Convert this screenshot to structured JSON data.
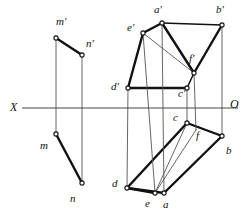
{
  "canvas": {
    "width": 248,
    "height": 217,
    "background": "#ffffff"
  },
  "style": {
    "line_color": "#111111",
    "thin_color": "#555555",
    "axis_color": "#444444",
    "vertex_fill": "#ffffff",
    "thick_width": 2.4,
    "medium_width": 1.5,
    "thin_width": 0.9,
    "axis_width": 1.0
  },
  "axis": {
    "name": "ground-line",
    "x1": 22,
    "y1": 108,
    "x2": 238,
    "y2": 108,
    "left_label": "X",
    "right_label": "O",
    "left_label_pos": {
      "x": 10,
      "y": 101
    },
    "right_label_pos": {
      "x": 230,
      "y": 98
    }
  },
  "vertices": [
    {
      "id": "m_top",
      "label": "m'",
      "x": 56,
      "y": 38,
      "label_x": 56,
      "label_y": 16,
      "marker": "circle"
    },
    {
      "id": "n_top",
      "label": "n'",
      "x": 82,
      "y": 55,
      "label_x": 86,
      "label_y": 38,
      "marker": "circle"
    },
    {
      "id": "m_bot",
      "label": "m",
      "x": 56,
      "y": 134,
      "label_x": 40,
      "label_y": 140,
      "marker": "circle"
    },
    {
      "id": "n_bot",
      "label": "n",
      "x": 82,
      "y": 183,
      "label_x": 70,
      "label_y": 193,
      "marker": "circle"
    },
    {
      "id": "a_top",
      "label": "a'",
      "x": 162,
      "y": 23,
      "label_x": 154,
      "label_y": 4,
      "marker": "circle"
    },
    {
      "id": "b_top",
      "label": "b'",
      "x": 222,
      "y": 25,
      "label_x": 216,
      "label_y": 4,
      "marker": "circle"
    },
    {
      "id": "e_top",
      "label": "e'",
      "x": 143,
      "y": 33,
      "label_x": 127,
      "label_y": 22,
      "marker": "circle"
    },
    {
      "id": "f_top",
      "label": "f'",
      "x": 194,
      "y": 73,
      "label_x": 189,
      "label_y": 53,
      "marker": "circle"
    },
    {
      "id": "d_top",
      "label": "d'",
      "x": 128,
      "y": 88,
      "label_x": 111,
      "label_y": 81,
      "marker": "circle"
    },
    {
      "id": "c_top",
      "label": "c'",
      "x": 187,
      "y": 88,
      "label_x": 178,
      "label_y": 88,
      "marker": "circle"
    },
    {
      "id": "c_bot",
      "label": "c",
      "x": 187,
      "y": 123,
      "label_x": 173,
      "label_y": 112,
      "marker": "circle"
    },
    {
      "id": "b_bot",
      "label": "b",
      "x": 222,
      "y": 136,
      "label_x": 226,
      "label_y": 145,
      "marker": "circle"
    },
    {
      "id": "f_bot",
      "label": "f",
      "x": 196,
      "y": 130,
      "label_x": 196,
      "label_y": 130,
      "marker": "none"
    },
    {
      "id": "d_bot",
      "label": "d",
      "x": 127,
      "y": 188,
      "label_x": 112,
      "label_y": 178,
      "marker": "circle"
    },
    {
      "id": "e_bot",
      "label": "e",
      "x": 155,
      "y": 193,
      "label_x": 145,
      "label_y": 198,
      "marker": "circle"
    },
    {
      "id": "a_bot",
      "label": "a",
      "x": 164,
      "y": 193,
      "label_x": 163,
      "label_y": 199,
      "marker": "circle"
    }
  ],
  "segments": [
    {
      "name": "segment-m-prime-n-prime",
      "weight": "thick",
      "x1": 56,
      "y1": 38,
      "x2": 82,
      "y2": 55
    },
    {
      "name": "segment-m-n",
      "weight": "thick",
      "x1": 56,
      "y1": 134,
      "x2": 82,
      "y2": 183
    },
    {
      "name": "projector-m",
      "weight": "thin",
      "x1": 56,
      "y1": 38,
      "x2": 56,
      "y2": 134
    },
    {
      "name": "projector-n",
      "weight": "thin",
      "x1": 82,
      "y1": 55,
      "x2": 82,
      "y2": 183
    },
    {
      "name": "edge-a-prime-b-prime",
      "weight": "medium",
      "x1": 162,
      "y1": 23,
      "x2": 222,
      "y2": 25
    },
    {
      "name": "edge-e-prime-a-prime",
      "weight": "thick",
      "x1": 143,
      "y1": 33,
      "x2": 162,
      "y2": 23
    },
    {
      "name": "edge-e-prime-d-prime",
      "weight": "thick",
      "x1": 143,
      "y1": 33,
      "x2": 128,
      "y2": 88
    },
    {
      "name": "edge-d-prime-c-prime",
      "weight": "thick",
      "x1": 128,
      "y1": 88,
      "x2": 187,
      "y2": 88
    },
    {
      "name": "edge-c-prime-f-prime",
      "weight": "medium",
      "x1": 187,
      "y1": 88,
      "x2": 194,
      "y2": 73
    },
    {
      "name": "edge-f-prime-b-prime",
      "weight": "thick",
      "x1": 194,
      "y1": 73,
      "x2": 222,
      "y2": 25
    },
    {
      "name": "edge-a-prime-f-prime",
      "weight": "thick",
      "x1": 162,
      "y1": 23,
      "x2": 194,
      "y2": 73
    },
    {
      "name": "diagonal-e-prime-f-prime",
      "weight": "thin",
      "x1": 143,
      "y1": 33,
      "x2": 194,
      "y2": 73
    },
    {
      "name": "edge-d-c-bottom",
      "weight": "thick",
      "x1": 127,
      "y1": 188,
      "x2": 187,
      "y2": 123
    },
    {
      "name": "edge-c-b-bottom",
      "weight": "thick",
      "x1": 187,
      "y1": 123,
      "x2": 222,
      "y2": 136
    },
    {
      "name": "edge-b-a-bottom",
      "weight": "thick",
      "x1": 222,
      "y1": 136,
      "x2": 164,
      "y2": 193
    },
    {
      "name": "edge-a-d-bottom",
      "weight": "thick",
      "x1": 164,
      "y1": 193,
      "x2": 127,
      "y2": 188
    },
    {
      "name": "edge-d-e-bottom",
      "weight": "thick",
      "x1": 127,
      "y1": 188,
      "x2": 155,
      "y2": 193
    },
    {
      "name": "edge-e-c-bottom",
      "weight": "thin",
      "x1": 155,
      "y1": 193,
      "x2": 187,
      "y2": 123
    },
    {
      "name": "edge-e-f-bottom",
      "weight": "thin",
      "x1": 155,
      "y1": 193,
      "x2": 196,
      "y2": 130
    },
    {
      "name": "projector-a",
      "weight": "thin",
      "x1": 162,
      "y1": 23,
      "x2": 164,
      "y2": 193
    },
    {
      "name": "projector-b",
      "weight": "thin",
      "x1": 222,
      "y1": 25,
      "x2": 222,
      "y2": 136
    },
    {
      "name": "projector-e",
      "weight": "thin",
      "x1": 143,
      "y1": 33,
      "x2": 155,
      "y2": 193
    },
    {
      "name": "projector-d",
      "weight": "thin",
      "x1": 128,
      "y1": 88,
      "x2": 127,
      "y2": 188
    },
    {
      "name": "projector-c",
      "weight": "thin",
      "x1": 187,
      "y1": 88,
      "x2": 187,
      "y2": 123
    },
    {
      "name": "projector-f",
      "weight": "thin",
      "x1": 194,
      "y1": 73,
      "x2": 196,
      "y2": 130
    }
  ]
}
